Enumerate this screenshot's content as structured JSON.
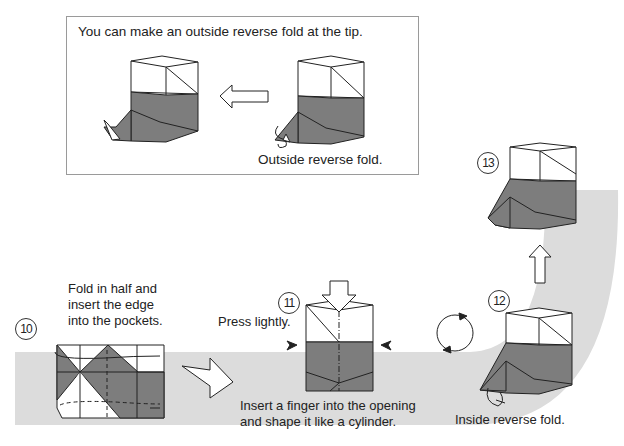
{
  "inset": {
    "title": "You can make an outside reverse fold at the tip.",
    "caption": "Outside reverse fold."
  },
  "steps": [
    {
      "number": "10",
      "instruction_lines": [
        "Fold in half and",
        "insert the edge",
        "into the pockets."
      ]
    },
    {
      "number": "11",
      "label": "Press lightly.",
      "instruction_lines": [
        "Insert a finger into the opening",
        "and shape it like a cylinder."
      ]
    },
    {
      "number": "12",
      "caption": "Inside reverse fold."
    },
    {
      "number": "13"
    }
  ],
  "colors": {
    "band": "#dcdcdc",
    "paper_dark": "#7d7d7d",
    "paper_light": "#ffffff",
    "line": "#222222"
  }
}
